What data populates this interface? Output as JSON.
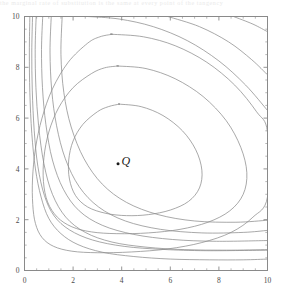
{
  "figure": {
    "width": 282,
    "height": 298,
    "background": "#ffffff",
    "frame_color": "#8a8a8a",
    "contour_color": "#8c8c8c",
    "tick_label_color": "#4a4a4a",
    "point_color": "#1a1a1a",
    "bleed_text": "the marginal rate of substitution is the same at every point of the tangency"
  },
  "annotations": [
    {
      "name": "point-Q",
      "label": "Q",
      "x": 3.85,
      "y": 4.2,
      "marker": "dot"
    }
  ],
  "chart_data": {
    "type": "line",
    "title": "",
    "subtitle": "",
    "xlabel": "",
    "ylabel": "",
    "xlim": [
      0,
      10
    ],
    "ylim": [
      0,
      10
    ],
    "xticks": [
      0,
      2,
      4,
      6,
      8,
      10
    ],
    "yticks": [
      0,
      2,
      4,
      6,
      8,
      10
    ],
    "xtick_labels": [
      "0",
      "2",
      "4",
      "6",
      "8",
      "10"
    ],
    "ytick_labels": [
      "0",
      "2",
      "4",
      "6",
      "8",
      "10"
    ],
    "minor_tick_step": 0.5,
    "grid": false,
    "legend": null,
    "legend_position": "none",
    "plot_style": "contour",
    "contour_note": "Nested level curves of a single-peaked surface; maximum near point Q. Inner levels are closed loops; outer levels open toward the two axes.",
    "series": [
      {
        "name": "level-1-inner",
        "closed": true,
        "points": [
          [
            3.9,
            6.55
          ],
          [
            4.8,
            6.45
          ],
          [
            5.7,
            6.1
          ],
          [
            6.5,
            5.5
          ],
          [
            7.05,
            4.75
          ],
          [
            7.3,
            3.95
          ],
          [
            7.2,
            3.25
          ],
          [
            6.75,
            2.72
          ],
          [
            6.0,
            2.38
          ],
          [
            5.1,
            2.2
          ],
          [
            4.2,
            2.16
          ],
          [
            3.35,
            2.25
          ],
          [
            2.6,
            2.5
          ],
          [
            2.1,
            2.95
          ],
          [
            1.85,
            3.6
          ],
          [
            1.82,
            4.35
          ],
          [
            2.0,
            5.1
          ],
          [
            2.4,
            5.75
          ],
          [
            3.0,
            6.25
          ],
          [
            3.45,
            6.45
          ],
          [
            3.9,
            6.55
          ]
        ]
      },
      {
        "name": "level-2",
        "closed": true,
        "points": [
          [
            3.85,
            8.05
          ],
          [
            5.0,
            7.95
          ],
          [
            6.2,
            7.55
          ],
          [
            7.35,
            6.85
          ],
          [
            8.3,
            5.9
          ],
          [
            8.9,
            4.85
          ],
          [
            9.15,
            3.85
          ],
          [
            9.0,
            3.0
          ],
          [
            8.45,
            2.35
          ],
          [
            7.55,
            1.9
          ],
          [
            6.4,
            1.62
          ],
          [
            5.1,
            1.48
          ],
          [
            3.8,
            1.45
          ],
          [
            2.75,
            1.52
          ],
          [
            1.95,
            1.72
          ],
          [
            1.35,
            2.1
          ],
          [
            0.95,
            2.7
          ],
          [
            0.78,
            3.5
          ],
          [
            0.8,
            4.45
          ],
          [
            1.0,
            5.45
          ],
          [
            1.4,
            6.4
          ],
          [
            2.0,
            7.2
          ],
          [
            2.75,
            7.75
          ],
          [
            3.3,
            7.98
          ],
          [
            3.85,
            8.05
          ]
        ]
      },
      {
        "name": "level-3",
        "closed": true,
        "points": [
          [
            3.6,
            9.3
          ],
          [
            4.9,
            9.2
          ],
          [
            6.2,
            8.85
          ],
          [
            7.5,
            8.2
          ],
          [
            8.65,
            7.3
          ],
          [
            9.55,
            6.25
          ],
          [
            10.0,
            5.45
          ],
          [
            10.0,
            2.9
          ],
          [
            9.4,
            2.1
          ],
          [
            8.5,
            1.5
          ],
          [
            7.3,
            1.1
          ],
          [
            5.9,
            0.85
          ],
          [
            4.4,
            0.73
          ],
          [
            3.0,
            0.7
          ],
          [
            1.95,
            0.76
          ],
          [
            1.2,
            0.95
          ],
          [
            0.72,
            1.3
          ],
          [
            0.45,
            1.85
          ],
          [
            0.34,
            2.6
          ],
          [
            0.33,
            3.6
          ],
          [
            0.45,
            4.8
          ],
          [
            0.72,
            6.0
          ],
          [
            1.15,
            7.15
          ],
          [
            1.8,
            8.2
          ],
          [
            2.6,
            8.95
          ],
          [
            3.1,
            9.2
          ],
          [
            3.6,
            9.3
          ]
        ]
      },
      {
        "name": "level-4-open",
        "closed": false,
        "points": [
          [
            2.6,
            10.0
          ],
          [
            3.9,
            9.9
          ],
          [
            5.3,
            9.6
          ],
          [
            6.7,
            9.05
          ],
          [
            8.0,
            8.25
          ],
          [
            9.1,
            7.3
          ],
          [
            10.0,
            6.3
          ]
        ]
      },
      {
        "name": "level-4-open-lower",
        "closed": false,
        "points": [
          [
            0.22,
            10.0
          ],
          [
            0.2,
            8.6
          ],
          [
            0.22,
            7.0
          ],
          [
            0.3,
            5.4
          ],
          [
            0.45,
            4.0
          ],
          [
            0.68,
            2.9
          ],
          [
            1.0,
            2.05
          ],
          [
            1.5,
            1.45
          ],
          [
            2.2,
            1.02
          ],
          [
            3.2,
            0.72
          ],
          [
            4.5,
            0.55
          ],
          [
            6.0,
            0.45
          ],
          [
            7.6,
            0.42
          ],
          [
            9.0,
            0.42
          ],
          [
            10.0,
            0.45
          ]
        ]
      },
      {
        "name": "level-5-open",
        "closed": false,
        "points": [
          [
            5.9,
            10.0
          ],
          [
            7.2,
            9.6
          ],
          [
            8.4,
            9.0
          ],
          [
            9.35,
            8.3
          ],
          [
            10.0,
            7.7
          ]
        ]
      },
      {
        "name": "level-6-corner",
        "closed": false,
        "points": [
          [
            8.6,
            10.0
          ],
          [
            9.4,
            9.7
          ],
          [
            10.0,
            9.4
          ]
        ]
      },
      {
        "name": "level-asym-1",
        "closed": false,
        "points": [
          [
            0.48,
            10.0
          ],
          [
            0.44,
            8.7
          ],
          [
            0.47,
            7.2
          ],
          [
            0.58,
            5.7
          ],
          [
            0.8,
            4.2
          ],
          [
            1.15,
            3.0
          ],
          [
            1.7,
            2.1
          ],
          [
            2.5,
            1.5
          ],
          [
            3.6,
            1.12
          ],
          [
            5.0,
            0.92
          ],
          [
            6.6,
            0.82
          ],
          [
            8.3,
            0.8
          ],
          [
            10.0,
            0.82
          ]
        ]
      },
      {
        "name": "level-asym-2",
        "closed": false,
        "points": [
          [
            0.75,
            10.0
          ],
          [
            0.7,
            8.7
          ],
          [
            0.74,
            7.2
          ],
          [
            0.88,
            5.75
          ],
          [
            1.15,
            4.35
          ],
          [
            1.6,
            3.2
          ],
          [
            2.25,
            2.35
          ],
          [
            3.2,
            1.78
          ],
          [
            4.5,
            1.42
          ],
          [
            6.1,
            1.22
          ],
          [
            7.9,
            1.15
          ],
          [
            10.0,
            1.18
          ]
        ]
      },
      {
        "name": "level-asym-3",
        "closed": false,
        "points": [
          [
            1.1,
            10.0
          ],
          [
            1.05,
            8.6
          ],
          [
            1.12,
            7.1
          ],
          [
            1.32,
            5.7
          ],
          [
            1.68,
            4.4
          ],
          [
            2.25,
            3.3
          ],
          [
            3.05,
            2.5
          ],
          [
            4.15,
            1.95
          ],
          [
            5.6,
            1.62
          ],
          [
            7.3,
            1.48
          ],
          [
            9.0,
            1.5
          ],
          [
            10.0,
            1.58
          ]
        ]
      },
      {
        "name": "level-asym-4",
        "closed": false,
        "points": [
          [
            1.55,
            10.0
          ],
          [
            1.5,
            8.5
          ],
          [
            1.62,
            7.0
          ],
          [
            1.92,
            5.65
          ],
          [
            2.45,
            4.4
          ],
          [
            3.2,
            3.4
          ],
          [
            4.2,
            2.68
          ],
          [
            5.5,
            2.2
          ],
          [
            7.0,
            1.95
          ],
          [
            8.7,
            1.9
          ],
          [
            10.0,
            1.98
          ]
        ]
      },
      {
        "name": "level-asym-5",
        "closed": false,
        "points": [
          [
            0.33,
            10.0
          ],
          [
            0.3,
            8.6
          ],
          [
            0.32,
            7.1
          ],
          [
            0.4,
            5.5
          ],
          [
            0.55,
            4.1
          ],
          [
            0.82,
            2.95
          ],
          [
            1.22,
            2.15
          ],
          [
            1.85,
            1.6
          ],
          [
            2.8,
            1.2
          ],
          [
            4.1,
            0.95
          ],
          [
            5.7,
            0.83
          ],
          [
            7.5,
            0.78
          ],
          [
            10.0,
            0.8
          ]
        ]
      }
    ]
  }
}
